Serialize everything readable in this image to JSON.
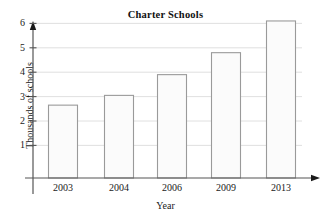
{
  "chart_data": {
    "type": "bar",
    "title": "Charter Schools",
    "xlabel": "Year",
    "ylabel": "Thousands of schools",
    "categories": [
      "2003",
      "2004",
      "2006",
      "2009",
      "2013"
    ],
    "values": [
      2.65,
      3.05,
      3.9,
      4.8,
      6.1
    ],
    "ylim": [
      0,
      6.6
    ],
    "yticks": [
      1,
      2,
      3,
      4,
      5,
      6
    ],
    "ytick_labels": [
      "1",
      "2",
      "3",
      "4",
      "5",
      "6"
    ],
    "grid": true,
    "grid_axis": "y",
    "legend": null,
    "legend_position": "none",
    "bar_fill_color": "#fbfbfb",
    "bar_edge_color": "#9a9a9a",
    "axis_color": "#555555",
    "grid_color": "#d8d8d8",
    "text_color": "#1a1a1a",
    "background_color": "#ffffff"
  }
}
